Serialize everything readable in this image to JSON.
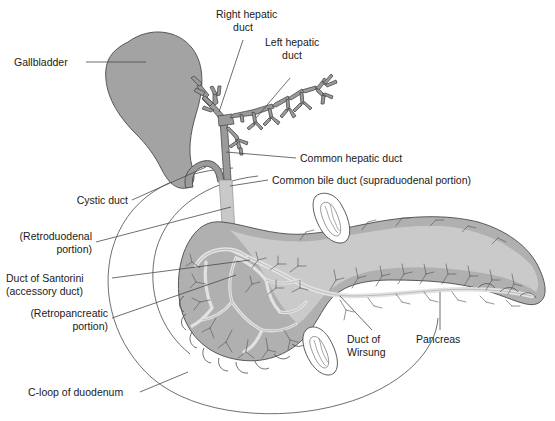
{
  "figure": {
    "background_color": "#ffffff",
    "line_color": "#4a4a4a",
    "text_color": "#1a1a1a",
    "colors": {
      "gallbladder_fill": "#a3a3a3",
      "duct_fill": "#9a9a9a",
      "duct_stroke": "#4a4a4a",
      "common_bile_duct_fill": "#c9c9c9",
      "pancreas_fill": "#b0b0b0",
      "pancreas_light_fill": "#cfcfcf",
      "pancreas_duct_fill": "#dcdcdc",
      "duodenum_stroke": "#6b6b6b",
      "duodenum_fill": "#ffffff"
    }
  },
  "labels": {
    "gallbladder": "Gallbladder",
    "right_hepatic_duct_l1": "Right hepatic",
    "right_hepatic_duct_l2": "duct",
    "left_hepatic_duct_l1": "Left hepatic",
    "left_hepatic_duct_l2": "duct",
    "common_hepatic_duct": "Common hepatic duct",
    "common_bile_duct": "Common bile duct (supraduodenal portion)",
    "cystic_duct": "Cystic duct",
    "retroduodenal_l1": "(Retroduodenal",
    "retroduodenal_l2": "portion)",
    "duct_of_santorini_l1": "Duct of Santorini",
    "duct_of_santorini_l2": "(accessory duct)",
    "retropancreatic_l1": "(Retropancreatic",
    "retropancreatic_l2": "portion)",
    "c_loop_of_duodenum": "C-loop of duodenum",
    "duct_of_wirsung_l1": "Duct of",
    "duct_of_wirsung_l2": "Wirsung",
    "pancreas": "Pancreas"
  }
}
